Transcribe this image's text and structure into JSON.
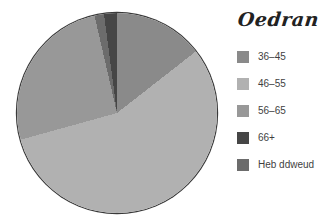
{
  "title": "Oedran",
  "chart_data": {
    "type": "pie",
    "title": "Oedran",
    "categories": [
      "36–45",
      "46–55",
      "56–65",
      "66+",
      "Heb ddweud"
    ],
    "values": [
      14.4,
      56.3,
      25.7,
      2.1,
      1.5
    ],
    "unit": "percent",
    "legend_position": "right",
    "grid": false,
    "outline_color": "#3a3a3a",
    "slices": [
      {
        "label": "36–45",
        "color": "#8a8a8a",
        "start_deg": 0,
        "end_deg": 52
      },
      {
        "label": "46–55",
        "color": "#b1b1b1",
        "start_deg": 52,
        "end_deg": 254.5
      },
      {
        "label": "56–65",
        "color": "#989898",
        "start_deg": 254.5,
        "end_deg": 347
      },
      {
        "label": "Heb ddweud",
        "color": "#6c6c6c",
        "start_deg": 347,
        "end_deg": 352.5
      },
      {
        "label": "66+",
        "color": "#464646",
        "start_deg": 352.5,
        "end_deg": 360
      }
    ]
  },
  "legend": {
    "items": [
      {
        "label": "36–45",
        "color": "#8a8a8a"
      },
      {
        "label": "46–55",
        "color": "#b1b1b1"
      },
      {
        "label": "56–65",
        "color": "#989898"
      },
      {
        "label": "66+",
        "color": "#464646"
      },
      {
        "label": "Heb ddweud",
        "color": "#6c6c6c"
      }
    ]
  }
}
